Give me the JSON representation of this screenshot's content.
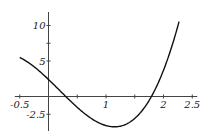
{
  "chart_data": {
    "type": "line",
    "title": "",
    "xlabel": "",
    "ylabel": "",
    "xlim": [
      -0.5,
      2.5
    ],
    "ylim": [
      -4.5,
      12
    ],
    "grid": false,
    "legend": null,
    "x_ticks": [
      -0.5,
      0.5,
      1,
      1.5,
      2,
      2.5
    ],
    "x_tick_labels": [
      "-0.5",
      "1",
      "2",
      "2.5"
    ],
    "y_ticks": [
      -2.5,
      5,
      7.5,
      10
    ],
    "y_tick_labels": [
      "-2.5",
      "5",
      "10"
    ],
    "series": [
      {
        "name": "f(x)",
        "color": "#111111",
        "x": [
          -0.5,
          -0.25,
          0,
          0.25,
          0.3,
          0.5,
          0.75,
          1.0,
          1.21,
          1.4,
          1.6,
          1.79,
          2.0,
          2.15,
          2.26
        ],
        "y": [
          5.5,
          3.9,
          2.4,
          0.3,
          0.0,
          -1.4,
          -2.9,
          -3.9,
          -4.2,
          -3.9,
          -2.6,
          0.0,
          3.9,
          7.3,
          10.3
        ]
      }
    ]
  },
  "axis": {
    "x_labels": [
      {
        "text": "-0.5",
        "value": -0.5
      },
      {
        "text": "1",
        "value": 1
      },
      {
        "text": "2",
        "value": 2
      },
      {
        "text": "2.5",
        "value": 2.5
      }
    ],
    "y_labels": [
      {
        "text": "10",
        "value": 10
      },
      {
        "text": "5",
        "value": 5
      },
      {
        "text": "-2.5",
        "value": -2.5
      }
    ]
  }
}
